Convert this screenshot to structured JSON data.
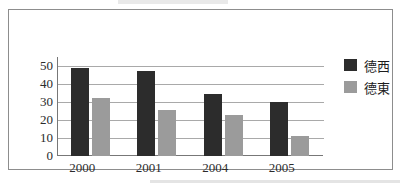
{
  "chart_data": {
    "type": "bar",
    "title": "",
    "xlabel": "",
    "ylabel": "",
    "categories": [
      "2000",
      "2001",
      "2004",
      "2005"
    ],
    "series": [
      {
        "name": "德西",
        "color": "#2c2c2c",
        "values": [
          49,
          47,
          34.5,
          30
        ]
      },
      {
        "name": "德東",
        "color": "#9b9b9b",
        "values": [
          32,
          25.5,
          23,
          11
        ]
      }
    ],
    "yticks": [
      "50",
      "40",
      "30",
      "20",
      "10",
      "0"
    ],
    "ylim": [
      0,
      55
    ],
    "grid": true,
    "legend_position": "right"
  },
  "legend": {
    "items": [
      {
        "label": "德西",
        "swatch": "dark-square-icon"
      },
      {
        "label": "德東",
        "swatch": "gray-square-icon"
      }
    ]
  },
  "colors": {
    "west_bar": "#2c2c2c",
    "east_bar": "#9b9b9b",
    "gridline": "#a9a9a9",
    "axis": "#777777",
    "frame_border": "#8d8d8d",
    "text": "#2b2b2b",
    "background": "#ffffff"
  }
}
